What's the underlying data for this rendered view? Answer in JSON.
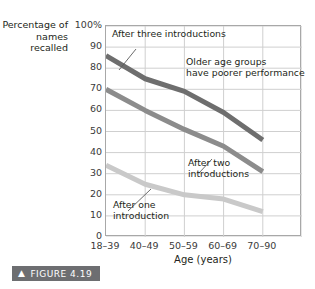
{
  "chart_data": {
    "type": "line",
    "title": "",
    "xlabel": "Age (years)",
    "ylabel": "Percentage of names recalled",
    "categories": [
      "18–39",
      "40–49",
      "50–59",
      "60–69",
      "70–90"
    ],
    "ylim": [
      0,
      100
    ],
    "yticks": [
      "0",
      "10",
      "20",
      "30",
      "40",
      "50",
      "60",
      "70",
      "80",
      "90",
      "100%"
    ],
    "ytick_values": [
      0,
      10,
      20,
      30,
      40,
      50,
      60,
      70,
      80,
      90,
      100
    ],
    "grid": true,
    "legend_position": "none",
    "series": [
      {
        "name": "After three introductions",
        "color": "#6e6e6e",
        "values": [
          86,
          75,
          69,
          59,
          46
        ]
      },
      {
        "name": "After two introductions",
        "color": "#8c8c8c",
        "values": [
          70,
          60,
          51,
          43,
          31
        ]
      },
      {
        "name": "After one introduction",
        "color": "#c9c9c9",
        "values": [
          34,
          25,
          20,
          18,
          12
        ]
      }
    ],
    "annotations": [
      {
        "text": "After three introductions"
      },
      {
        "text": "Older age groups\nhave poorer performance"
      },
      {
        "text": "After two\nintroductions"
      },
      {
        "text": "After one\nintroduction"
      }
    ]
  },
  "axis": {
    "y_title": "Percentage\nof names\nrecalled",
    "x_title": "Age (years)"
  },
  "caption": {
    "chevron": "▲",
    "label": "FIGURE 4.19"
  }
}
